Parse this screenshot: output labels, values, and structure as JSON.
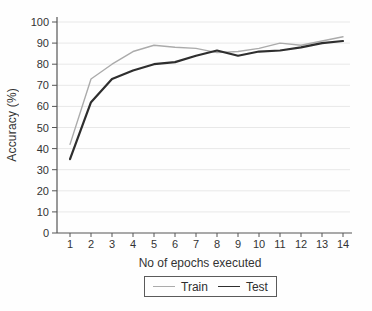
{
  "chart_data": {
    "type": "line",
    "xlabel": "No of epochs executed",
    "ylabel": "Accuracy (%)",
    "x": [
      1,
      2,
      3,
      4,
      5,
      6,
      7,
      8,
      9,
      10,
      11,
      12,
      13,
      14
    ],
    "xticks": [
      1,
      2,
      3,
      4,
      5,
      6,
      7,
      8,
      9,
      10,
      11,
      12,
      13,
      14
    ],
    "yticks": [
      0,
      10,
      20,
      30,
      40,
      50,
      60,
      70,
      80,
      90,
      100
    ],
    "xlim": [
      1,
      14
    ],
    "ylim": [
      0,
      100
    ],
    "grid": "horizontal",
    "legend_position": "bottom-center",
    "series": [
      {
        "name": "Train",
        "color": "#ababab",
        "width": 1.4,
        "values": [
          42,
          73,
          80,
          86,
          89,
          88,
          87.5,
          85.5,
          86,
          87.5,
          90,
          89,
          91,
          93
        ]
      },
      {
        "name": "Test",
        "color": "#2e2e2e",
        "width": 2.2,
        "values": [
          35,
          62,
          73,
          77,
          80,
          81,
          84,
          86.5,
          84,
          86,
          86.5,
          88,
          90,
          91
        ]
      }
    ],
    "style": {
      "grid_color": "#e8e8e8",
      "axis_color": "#555555",
      "text_color": "#333333",
      "legend_border_color": "#5a5a5a",
      "background": "#fefefe"
    }
  }
}
